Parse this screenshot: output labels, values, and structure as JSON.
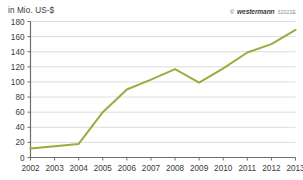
{
  "figure": {
    "unit_label": "in Mio. US-$",
    "credit": {
      "copyright_mark": "©",
      "brand": "westermann",
      "code": "32022E"
    }
  },
  "chart_data": {
    "type": "line",
    "title": "",
    "subtitle": "",
    "xlabel": "",
    "ylabel": "in Mio. US-$",
    "categories": [
      "2002",
      "2003",
      "2004",
      "2005",
      "2006",
      "2007",
      "2008",
      "2009",
      "2010",
      "2011",
      "2012",
      "2013"
    ],
    "x": [
      2002,
      2003,
      2004,
      2005,
      2006,
      2007,
      2008,
      2009,
      2010,
      2011,
      2012,
      2013
    ],
    "values": [
      12,
      15,
      18,
      60,
      90,
      103,
      117,
      99,
      118,
      139,
      150,
      169
    ],
    "series": [
      {
        "name": "in Mio. US-$",
        "values": [
          12,
          15,
          18,
          60,
          90,
          103,
          117,
          99,
          118,
          139,
          150,
          169
        ],
        "color": "#9aad3c"
      }
    ],
    "ylim": [
      0,
      180
    ],
    "yticks": [
      0,
      20,
      40,
      60,
      80,
      100,
      120,
      140,
      160,
      180
    ],
    "ytick_labels": [
      "0",
      "20",
      "40",
      "60",
      "80",
      "100",
      "120",
      "140",
      "160",
      "180"
    ],
    "xtick_labels": [
      "2002",
      "2003",
      "2004",
      "2005",
      "2006",
      "2007",
      "2008",
      "2009",
      "2010",
      "2011",
      "2012",
      "2013"
    ],
    "grid": true,
    "grid_axis": "y",
    "legend": false,
    "legend_position": "none",
    "line_color": "#9aad3c",
    "line_width": 2,
    "axis_color": "#6e6e6e",
    "grid_color": "#dcdcdc",
    "background_color": "#ffffff",
    "annotations": []
  }
}
